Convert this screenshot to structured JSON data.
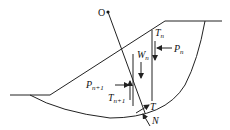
{
  "diagram": {
    "type": "slope-stability-slice-method",
    "center_label": "O",
    "labels": {
      "T_n": {
        "base": "T",
        "sub": "n"
      },
      "W_n": {
        "base": "W",
        "sub": "n"
      },
      "P_n": {
        "base": "P",
        "sub": "n"
      },
      "P_n1": {
        "base": "P",
        "sub": "n+1"
      },
      "T_n1": {
        "base": "T",
        "sub": "n+1"
      },
      "T": {
        "base": "T"
      },
      "N": {
        "base": "N"
      }
    },
    "colors": {
      "line": "#222222",
      "text": "#111111",
      "background": "#ffffff"
    }
  }
}
